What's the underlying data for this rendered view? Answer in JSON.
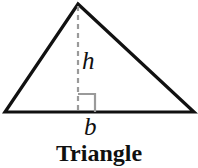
{
  "figure": {
    "caption": "Triangle",
    "background_color": "#ffffff",
    "stroke_color": "#111111",
    "guide_color": "#9a9a9a",
    "labels": {
      "height": "h",
      "base": "b"
    },
    "geometry": {
      "type": "triangle",
      "apex": [
        78,
        4
      ],
      "left_vertex": [
        5,
        112
      ],
      "right_vertex": [
        194,
        112
      ],
      "base_label_anchor": [
        90,
        126
      ],
      "height_label_anchor": [
        88,
        62
      ],
      "altitude_foot": [
        78,
        112
      ],
      "right_angle_marker": {
        "corner": [
          78,
          112
        ],
        "size": 18,
        "opens": "right"
      }
    },
    "icons": {
      "right_angle": "right-angle-icon",
      "dashed_altitude": "dashed-line-icon"
    }
  }
}
